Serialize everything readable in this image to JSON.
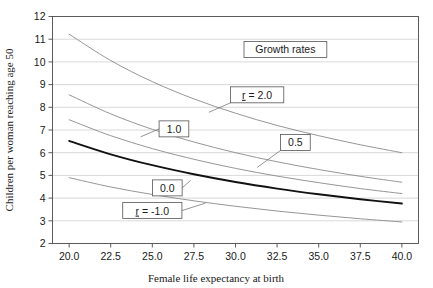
{
  "chart_data": {
    "type": "line",
    "title": "",
    "xlabel": "Female life expectancy at birth",
    "ylabel": "Children per woman reaching age 50",
    "xlim": [
      19.0,
      41.0
    ],
    "ylim": [
      2,
      12
    ],
    "xticks": [
      "20.0",
      "22.5",
      "25.0",
      "27.5",
      "30.0",
      "32.5",
      "35.0",
      "37.5",
      "40.0"
    ],
    "xtick_values": [
      20.0,
      22.5,
      25.0,
      27.5,
      30.0,
      32.5,
      35.0,
      37.5,
      40.0
    ],
    "yticks": [
      "2",
      "3",
      "4",
      "5",
      "6",
      "7",
      "8",
      "9",
      "10",
      "11",
      "12"
    ],
    "ytick_values": [
      2,
      3,
      4,
      5,
      6,
      7,
      8,
      9,
      10,
      11,
      12
    ],
    "grid": "horizontal",
    "legend_position": "none",
    "legend_title": "Growth rates",
    "x": [
      20.0,
      22.5,
      25.0,
      27.5,
      30.0,
      32.5,
      35.0,
      37.5,
      40.0
    ],
    "series": [
      {
        "name": "r = 2.0",
        "label": "r = 2.0",
        "emphasis": false,
        "values": [
          11.22,
          10.06,
          9.13,
          8.37,
          7.74,
          7.2,
          6.75,
          6.35,
          6.0
        ]
      },
      {
        "name": "r = 1.0",
        "label": "1.0",
        "emphasis": false,
        "values": [
          8.55,
          7.71,
          7.03,
          6.47,
          6.0,
          5.6,
          5.26,
          4.96,
          4.7
        ]
      },
      {
        "name": "r = 0.5",
        "label": "0.5",
        "emphasis": false,
        "values": [
          7.45,
          6.75,
          6.18,
          5.71,
          5.31,
          4.97,
          4.68,
          4.42,
          4.2
        ]
      },
      {
        "name": "r = 0.0",
        "label": "0.0",
        "emphasis": true,
        "values": [
          6.52,
          5.93,
          5.45,
          5.05,
          4.71,
          4.42,
          4.17,
          3.95,
          3.76
        ]
      },
      {
        "name": "r = -1.0",
        "label": "r = -1.0",
        "emphasis": false,
        "values": [
          4.9,
          4.49,
          4.16,
          3.88,
          3.64,
          3.43,
          3.25,
          3.09,
          2.95
        ]
      }
    ],
    "annotations": [
      {
        "text": "Growth rates",
        "x": 33.0,
        "y": 10.55
      },
      {
        "text": "r = 2.0",
        "x": 31.3,
        "y": 8.55
      },
      {
        "text": "1.0",
        "x": 26.3,
        "y": 7.05
      },
      {
        "text": "0.5",
        "x": 33.6,
        "y": 6.45
      },
      {
        "text": "0.0",
        "x": 25.9,
        "y": 4.45
      },
      {
        "text": "r = -1.0",
        "x": 25.0,
        "y": 3.45
      }
    ]
  }
}
